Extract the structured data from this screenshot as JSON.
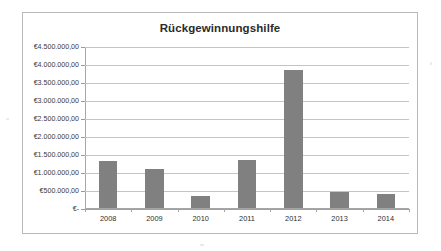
{
  "chart_data": {
    "type": "bar",
    "title": "Rückgewinnungshilfe",
    "xlabel": "",
    "ylabel": "",
    "categories": [
      "2008",
      "2009",
      "2010",
      "2011",
      "2012",
      "2013",
      "2014"
    ],
    "values": [
      1320000,
      1120000,
      350000,
      1370000,
      3870000,
      480000,
      420000
    ],
    "series": [
      {
        "name": "Rückgewinnungshilfe",
        "values": [
          1320000,
          1120000,
          350000,
          1370000,
          3870000,
          480000,
          420000
        ]
      }
    ],
    "ylim": [
      0,
      4500000
    ],
    "ytick_values": [
      0,
      500000,
      1000000,
      1500000,
      2000000,
      2500000,
      3000000,
      3500000,
      4000000,
      4500000
    ],
    "ytick_labels": [
      "€-",
      "€500.000,00",
      "€1.000.000,00",
      "€1.500.000,00",
      "€2.000.000,00",
      "€2.500.000,00",
      "€3.000.000,00",
      "€3.500.000,00",
      "€4.000.000,00",
      "€4.500.000,00"
    ],
    "grid": true,
    "legend": false,
    "legend_position": "none",
    "bar_color": "#808080",
    "gridline_color": "#c4c4c4",
    "axis_color": "#a6a6a6",
    "plot_background": "#ffffff",
    "currency_symbol": "€",
    "decimal_separator": ",",
    "thousands_separator": "."
  }
}
